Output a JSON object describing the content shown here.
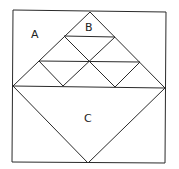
{
  "diagram": {
    "labels": {
      "a": "A",
      "b": "B",
      "c": "C"
    },
    "stroke_color": "#2a2a2a",
    "background": "#ffffff"
  }
}
